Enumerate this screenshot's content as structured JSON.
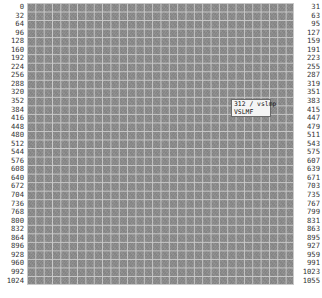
{
  "viewer": {
    "grid": {
      "rows": 33,
      "columns": 32,
      "cell_color": "#8d8d8d",
      "line_color": "#c9c9c9"
    },
    "left_labels": [
      "0",
      "32",
      "64",
      "96",
      "128",
      "160",
      "192",
      "224",
      "256",
      "288",
      "320",
      "352",
      "384",
      "416",
      "448",
      "480",
      "512",
      "544",
      "576",
      "608",
      "640",
      "672",
      "704",
      "736",
      "768",
      "800",
      "832",
      "864",
      "896",
      "928",
      "960",
      "992",
      "1024"
    ],
    "right_labels": [
      "31",
      "63",
      "95",
      "127",
      "159",
      "191",
      "223",
      "255",
      "287",
      "319",
      "351",
      "383",
      "415",
      "447",
      "479",
      "511",
      "543",
      "575",
      "607",
      "639",
      "671",
      "703",
      "735",
      "767",
      "799",
      "831",
      "863",
      "895",
      "927",
      "959",
      "991",
      "1023",
      "1055"
    ],
    "tooltip": {
      "line1": "312 / vslmp",
      "line2": "VSLMF"
    }
  }
}
